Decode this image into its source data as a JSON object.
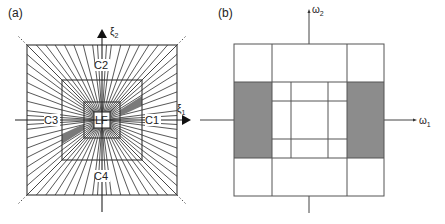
{
  "panel_a": {
    "label": "(a)",
    "axis_x_label": "ξ",
    "axis_x_sub": "1",
    "axis_y_label": "ξ",
    "axis_y_sub": "2",
    "regions": {
      "c1": "C1",
      "c2": "C2",
      "c3": "C3",
      "c4": "C4",
      "lf": "LF"
    },
    "geometry": {
      "center": [
        102,
        120
      ],
      "outer_half": 75,
      "middle_half": 40,
      "inner_half": 18,
      "lf_half": 8,
      "rays_per_half_side": 8
    },
    "shade_color": "#7a7a7a"
  },
  "panel_b": {
    "label": "(b)",
    "axis_x_label": "ω",
    "axis_x_sub": "1",
    "axis_y_label": "ω",
    "axis_y_sub": "2",
    "grid": {
      "outer": [
        234,
        44,
        384,
        196
      ],
      "v_lines": [
        272,
        347
      ],
      "h_lines": [
        82,
        158
      ],
      "inner_v_lines": [
        291,
        328
      ],
      "inner_h_lines": [
        101,
        139
      ]
    },
    "shade_color": "#8c8c8c"
  }
}
